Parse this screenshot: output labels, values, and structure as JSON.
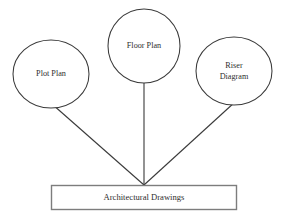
{
  "diagram": {
    "type": "hierarchy-diagram",
    "title_text": "Architectural Drawings",
    "background_color": "#ffffff",
    "stroke_color": "#3a3a3a",
    "box_border_color": "#7d7d7d",
    "text_color": "#2e2e2e",
    "root": {
      "label": "Architectural Drawings",
      "shape": "rectangle",
      "x": 51,
      "y": 185,
      "width": 186,
      "height": 25
    },
    "nodes": [
      {
        "id": "plot-plan",
        "label": "Plot Plan",
        "lines": [
          "Plot Plan"
        ],
        "shape": "ellipse",
        "cx": 51,
        "cy": 74,
        "rx": 38,
        "ry": 34
      },
      {
        "id": "floor-plan",
        "label": "Floor Plan",
        "lines": [
          "Floor Plan"
        ],
        "shape": "ellipse",
        "cx": 144,
        "cy": 46,
        "rx": 36,
        "ry": 37
      },
      {
        "id": "riser-diagram",
        "label": "Riser Diagram",
        "lines": [
          "Riser",
          "Diagram"
        ],
        "shape": "ellipse",
        "cx": 234,
        "cy": 71,
        "rx": 38,
        "ry": 34
      }
    ],
    "connectors": [
      {
        "id": "plot-plan-to-root",
        "from": "plot-plan",
        "to": "root",
        "x1": 52,
        "y1": 104,
        "x2": 144,
        "y2": 185
      },
      {
        "id": "floor-plan-to-root",
        "from": "floor-plan",
        "to": "root",
        "x1": 144,
        "y1": 83,
        "x2": 144,
        "y2": 185
      },
      {
        "id": "riser-diagram-to-root",
        "from": "riser-diagram",
        "to": "root",
        "x1": 235,
        "y1": 102,
        "x2": 144,
        "y2": 185
      }
    ]
  }
}
